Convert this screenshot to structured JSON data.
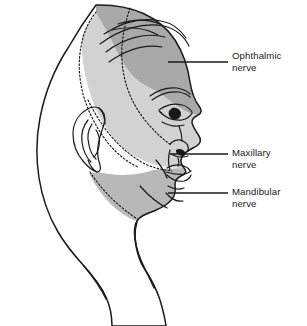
{
  "figure": {
    "view": "lateral head profile, facing right",
    "background_color": "#ffffff",
    "outline_color": "#1a1a1a",
    "width": 307,
    "height": 326
  },
  "labels": [
    {
      "id": "ophthalmic",
      "line1": "Ophthalmic",
      "line2": "nerve",
      "zone_color": "#a9a9a9",
      "leader_from_x": 232,
      "leader_to_x": 168,
      "leader_y": 62
    },
    {
      "id": "maxillary",
      "line1": "Maxillary",
      "line2": "nerve",
      "zone_color": "#d2d2d2",
      "leader_from_x": 232,
      "leader_to_x": 170,
      "leader_y": 154
    },
    {
      "id": "mandibular",
      "line1": "Mandibular",
      "line2": "nerve",
      "zone_color": "#b8b8b8",
      "leader_from_x": 232,
      "leader_to_x": 168,
      "leader_y": 193
    }
  ],
  "zones": [
    {
      "name": "ophthalmic-zone",
      "description": "forehead, scalp vertex, upper eyelid and bridge of nose",
      "fill": "#a9a9a9"
    },
    {
      "name": "maxillary-zone",
      "description": "temple, cheek, lower eyelid, lateral nose and upper lip",
      "fill": "#d2d2d2"
    },
    {
      "name": "mandibular-zone",
      "description": "lower lip, chin, jaw and preauricular region",
      "fill": "#b8b8b8"
    },
    {
      "name": "unshaded-zone",
      "description": "occipital scalp, posterior head and neck, not trigeminal",
      "fill": "#ffffff"
    }
  ],
  "features": [
    {
      "name": "hair-strokes",
      "count": 6
    },
    {
      "name": "ear",
      "description": "helix, antihelix, concha, lobule"
    },
    {
      "name": "eye",
      "description": "eyebrow, upper and lower lid, iris, pupil"
    },
    {
      "name": "nose",
      "description": "dorsum, tip, nostril, alar crease"
    },
    {
      "name": "lips",
      "description": "upper and lower lip with philtrum"
    },
    {
      "name": "chin-crease",
      "description": "mentolabial sulcus"
    },
    {
      "name": "neck",
      "description": "anterior and posterior neck contour"
    }
  ],
  "style": {
    "dotted_boundary_color": "#1a1a1a",
    "dotted_dash_pattern": "1.6 2.1",
    "stroke_width_outline": 1.5,
    "stroke_width_detail": 1.1,
    "label_font_size_px": 9.6
  }
}
